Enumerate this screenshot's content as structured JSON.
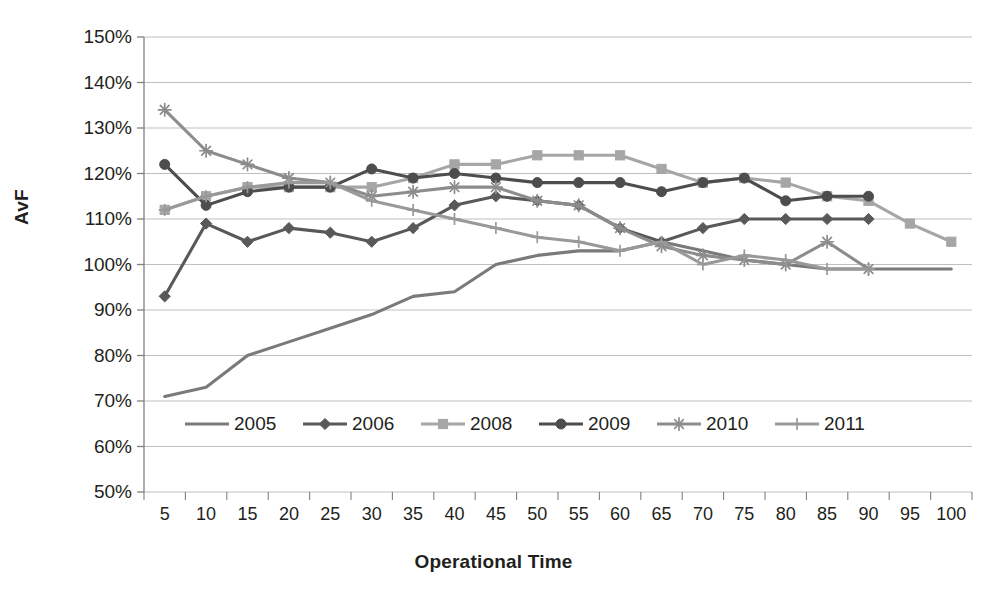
{
  "chart_data": {
    "type": "line",
    "title": "",
    "xlabel": "Operational Time",
    "ylabel": "AvF",
    "grid": true,
    "legend_position": "inside-bottom",
    "x": [
      5,
      10,
      15,
      20,
      25,
      30,
      35,
      40,
      45,
      50,
      55,
      60,
      65,
      70,
      75,
      80,
      85,
      90,
      95,
      100
    ],
    "xtick_labels": [
      "5",
      "10",
      "15",
      "20",
      "25",
      "30",
      "35",
      "40",
      "45",
      "50",
      "55",
      "60",
      "65",
      "70",
      "75",
      "80",
      "85",
      "90",
      "95",
      "100"
    ],
    "ytick_labels": [
      "50%",
      "60%",
      "70%",
      "80%",
      "90%",
      "100%",
      "110%",
      "120%",
      "130%",
      "140%",
      "150%"
    ],
    "yticks": [
      50,
      60,
      70,
      80,
      90,
      100,
      110,
      120,
      130,
      140,
      150
    ],
    "ylim": [
      50,
      150
    ],
    "y_unit": "%",
    "series": [
      {
        "name": "2005",
        "marker": "none",
        "color": "#7a7a7a",
        "values": [
          71,
          73,
          80,
          83,
          86,
          89,
          93,
          94,
          100,
          102,
          103,
          103,
          105,
          103,
          101,
          100,
          99,
          99,
          99,
          99
        ]
      },
      {
        "name": "2006",
        "marker": "diamond",
        "color": "#595959",
        "values": [
          93,
          109,
          105,
          108,
          107,
          105,
          108,
          113,
          115,
          114,
          113,
          108,
          105,
          108,
          110,
          110,
          110,
          110,
          null,
          null
        ]
      },
      {
        "name": "2008",
        "marker": "square",
        "color": "#a6a6a6",
        "values": [
          112,
          115,
          117,
          117,
          117,
          117,
          119,
          122,
          122,
          124,
          124,
          124,
          121,
          118,
          119,
          118,
          115,
          114,
          109,
          105
        ]
      },
      {
        "name": "2009",
        "marker": "circle",
        "color": "#4d4d4d",
        "values": [
          122,
          113,
          116,
          117,
          117,
          121,
          119,
          120,
          119,
          118,
          118,
          118,
          116,
          118,
          119,
          114,
          115,
          115,
          null,
          null
        ]
      },
      {
        "name": "2010",
        "marker": "star",
        "color": "#8c8c8c",
        "values": [
          134,
          125,
          122,
          119,
          118,
          115,
          116,
          117,
          117,
          114,
          113,
          108,
          104,
          102,
          101,
          100,
          105,
          99,
          null,
          null
        ]
      },
      {
        "name": "2011",
        "marker": "plus",
        "color": "#999999",
        "values": [
          112,
          115,
          117,
          118,
          118,
          114,
          112,
          110,
          108,
          106,
          105,
          103,
          105,
          100,
          102,
          101,
          99,
          99,
          null,
          null
        ]
      }
    ]
  },
  "legend": {
    "items": [
      {
        "label": "2005"
      },
      {
        "label": "2006"
      },
      {
        "label": "2008"
      },
      {
        "label": "2009"
      },
      {
        "label": "2010"
      },
      {
        "label": "2011"
      }
    ]
  },
  "colors": {
    "axis": "#808080",
    "grid": "#bfbfbf",
    "text": "#231f20",
    "background": "#ffffff"
  }
}
